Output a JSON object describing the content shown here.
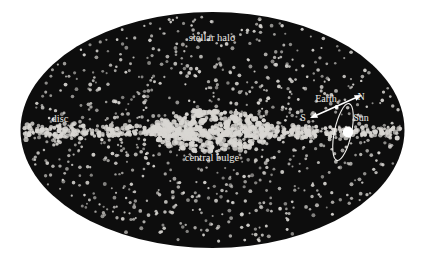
{
  "figure": {
    "canvas": {
      "width": 424,
      "height": 260
    },
    "background_color": "#ffffff",
    "galaxy_fill_color": "#0d0d0d",
    "star_color": "#d8d6d2",
    "label_color": "#eceae6",
    "marker_color": "#ffffff"
  },
  "galaxy": {
    "outline": {
      "cx": 212.5,
      "cy": 130,
      "rx": 192,
      "ry": 118
    }
  },
  "labels": {
    "stellar_halo": "stellar halo",
    "disc": "disc",
    "central_bulge": "central bulge",
    "earth": "Earth",
    "sun": "Sun",
    "north_pole": "N",
    "south_pole": "S"
  },
  "label_positions": {
    "stellar_halo": {
      "x": 212,
      "y": 41
    },
    "disc": {
      "x": 60,
      "y": 122
    },
    "central_bulge": {
      "x": 212,
      "y": 161
    },
    "earth": {
      "x": 326,
      "y": 102
    },
    "sun": {
      "x": 361,
      "y": 121
    },
    "north_pole": {
      "x": 361,
      "y": 100
    },
    "south_pole": {
      "x": 303,
      "y": 121
    }
  },
  "markers": {
    "sun": {
      "cx": 348,
      "cy": 132,
      "r": 5.2
    },
    "earth": {
      "cx": 336.5,
      "cy": 107,
      "r": 1.9
    },
    "orbit_ellipse": {
      "cx": 343,
      "cy": 132,
      "rx": 8.5,
      "ry": 29,
      "rotation_deg": 12
    },
    "rotation_axis_arrow": {
      "from": {
        "x": 310,
        "y": 118
      },
      "to": {
        "x": 362,
        "y": 95
      },
      "double_headed": true
    }
  },
  "star_field": {
    "description": "Scattered point stars: sparse in the halo, concentrated in a thin horizontal disc band, densest in the central bulge.",
    "components": [
      {
        "name": "stellar-halo",
        "count": 900,
        "size_px": [
          1,
          2
        ],
        "distribution": "uniform-elliptical"
      },
      {
        "name": "disc",
        "count": 520,
        "size_px": [
          1.3,
          2.6
        ],
        "band_center_y": 132,
        "band_half_height": 9
      },
      {
        "name": "central-bulge",
        "count": 330,
        "size_px": [
          1.6,
          3.0
        ],
        "cx": 212,
        "cy": 131,
        "rx": 62,
        "ry": 21
      }
    ]
  }
}
